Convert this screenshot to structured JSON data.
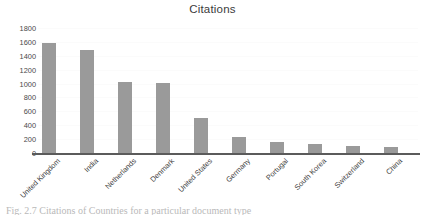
{
  "chart_data": {
    "type": "bar",
    "title": "Citations",
    "xlabel": "",
    "ylabel": "",
    "categories": [
      "United Kingdom",
      "India",
      "Netherlands",
      "Denmark",
      "United States",
      "Germany",
      "Portugal",
      "South Korea",
      "Switzerland",
      "China"
    ],
    "values": [
      1580,
      1480,
      1020,
      1010,
      500,
      230,
      160,
      130,
      100,
      85
    ],
    "ylim": [
      0,
      1800
    ],
    "ytick_labels": [
      "0",
      "200",
      "400",
      "600",
      "800",
      "1000",
      "1200",
      "1400",
      "1600",
      "1800"
    ],
    "ytick_values": [
      0,
      200,
      400,
      600,
      800,
      1000,
      1200,
      1400,
      1600,
      1800
    ],
    "grid": true,
    "legend": false,
    "bar_color": "#9a9a9a",
    "axis_color": "#5b5b5b",
    "background_color": "#ffffff"
  },
  "caption": {
    "text": "Fig. 2.7   Citations of Countries for a particular document type"
  }
}
